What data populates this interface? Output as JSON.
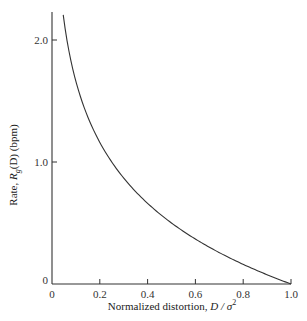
{
  "chart_data": {
    "type": "line",
    "title": "",
    "xlabel": "Normalized distortion, D / σ²",
    "xlabel_parts": {
      "text": "Normalized distortion,",
      "var": "D / σ",
      "sup": "2"
    },
    "ylabel": "Rate, R_g(D) (bpm)",
    "ylabel_parts": {
      "pre": "Rate, ",
      "var": "R",
      "sub": "g",
      "post": "(D) (bpm)"
    },
    "xlim": [
      0,
      1.0
    ],
    "ylim": [
      0,
      2.2
    ],
    "grid": false,
    "legend": null,
    "x_ticks": [
      "0",
      "0.2",
      "0.4",
      "0.6",
      "0.8",
      "1.0"
    ],
    "y_ticks": [
      "0",
      "1.0",
      "2.0"
    ],
    "series": [
      {
        "name": "R_g(D) = ½ log2(σ²/D)",
        "x": [
          0.047,
          0.06,
          0.08,
          0.1,
          0.15,
          0.2,
          0.25,
          0.3,
          0.4,
          0.5,
          0.6,
          0.7,
          0.8,
          0.9,
          1.0
        ],
        "y": [
          2.2,
          2.03,
          1.82,
          1.66,
          1.37,
          1.16,
          1.0,
          0.87,
          0.66,
          0.5,
          0.37,
          0.26,
          0.16,
          0.08,
          0.0
        ]
      }
    ]
  }
}
